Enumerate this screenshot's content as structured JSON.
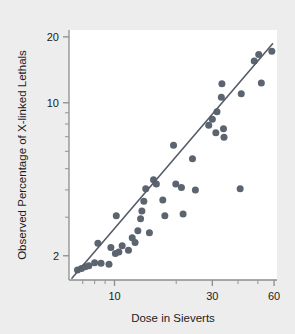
{
  "figure": {
    "background_color": "#ededed",
    "plot_background_color": "#ffffff",
    "marker_color": "#5c6470",
    "line_color": "#555d68",
    "axis_color": "#8d8d8d"
  },
  "chart_data": {
    "type": "scatter",
    "title": "",
    "xlabel": "Dose in Sieverts",
    "ylabel": "Observed Percentage of X-linked Lethals",
    "xscale": "log",
    "yscale": "log",
    "xlim": [
      6.0,
      62.0
    ],
    "ylim": [
      1.55,
      21.5
    ],
    "xticks": [
      10,
      30,
      60
    ],
    "xticklabels": [
      "10",
      "30",
      "60"
    ],
    "xticks_minor": [
      7,
      8,
      9,
      20,
      40,
      50
    ],
    "yticks": [
      2,
      10,
      20
    ],
    "yticklabels": [
      "2",
      "10",
      "20"
    ],
    "yticks_minor": [
      3,
      4,
      5,
      6,
      7,
      8,
      9
    ],
    "grid": false,
    "legend": null,
    "points": [
      [
        6.6,
        1.72
      ],
      [
        6.9,
        1.75
      ],
      [
        7.2,
        1.78
      ],
      [
        7.5,
        1.8
      ],
      [
        8.0,
        1.86
      ],
      [
        8.6,
        1.85
      ],
      [
        9.4,
        1.83
      ],
      [
        8.3,
        2.28
      ],
      [
        9.6,
        2.18
      ],
      [
        10.1,
        2.05
      ],
      [
        10.5,
        2.08
      ],
      [
        10.9,
        2.22
      ],
      [
        10.2,
        3.05
      ],
      [
        11.7,
        2.12
      ],
      [
        12.2,
        2.42
      ],
      [
        12.6,
        2.3
      ],
      [
        13.0,
        2.6
      ],
      [
        13.4,
        2.95
      ],
      [
        13.6,
        3.2
      ],
      [
        13.9,
        3.55
      ],
      [
        14.2,
        4.05
      ],
      [
        14.8,
        2.55
      ],
      [
        15.5,
        4.45
      ],
      [
        16.0,
        4.25
      ],
      [
        17.2,
        3.6
      ],
      [
        17.6,
        3.05
      ],
      [
        19.4,
        6.4
      ],
      [
        19.9,
        4.25
      ],
      [
        21.2,
        4.1
      ],
      [
        21.6,
        3.1
      ],
      [
        24.0,
        5.55
      ],
      [
        24.8,
        4.0
      ],
      [
        28.8,
        7.9
      ],
      [
        30.0,
        8.4
      ],
      [
        31.2,
        7.3
      ],
      [
        31.6,
        9.1
      ],
      [
        33.2,
        10.6
      ],
      [
        33.4,
        12.2
      ],
      [
        34.0,
        7.6
      ],
      [
        34.2,
        6.95
      ],
      [
        41.0,
        4.05
      ],
      [
        41.5,
        11.0
      ],
      [
        48.0,
        15.5
      ],
      [
        50.5,
        16.6
      ],
      [
        52.0,
        12.3
      ],
      [
        58.5,
        17.2
      ]
    ],
    "fit_line": {
      "x": [
        6.2,
        59.0
      ],
      "y": [
        1.58,
        18.6
      ],
      "description": "linear regression on log-log axes"
    }
  }
}
